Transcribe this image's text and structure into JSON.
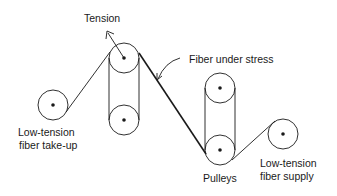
{
  "diagram": {
    "labels": {
      "tension": "Tension",
      "fiber_under_stress": "Fiber under stress",
      "takeup_line1": "Low-tension",
      "takeup_line2": "fiber take-up",
      "pulleys": "Pulleys",
      "supply_line1": "Low-tension",
      "supply_line2": "fiber supply"
    },
    "colors": {
      "line": "#1a1a1a",
      "background": "#ffffff"
    },
    "components": [
      {
        "name": "take-up-reel",
        "cx": 53,
        "cy": 105,
        "r": 15
      },
      {
        "name": "left-pulley-top",
        "cx": 124,
        "cy": 58,
        "r": 15
      },
      {
        "name": "left-pulley-bottom",
        "cx": 124,
        "cy": 120,
        "r": 15
      },
      {
        "name": "right-pulley-top",
        "cx": 220,
        "cy": 88,
        "r": 15
      },
      {
        "name": "right-pulley-bottom",
        "cx": 220,
        "cy": 150,
        "r": 15
      },
      {
        "name": "supply-reel",
        "cx": 283,
        "cy": 134,
        "r": 15
      }
    ]
  }
}
